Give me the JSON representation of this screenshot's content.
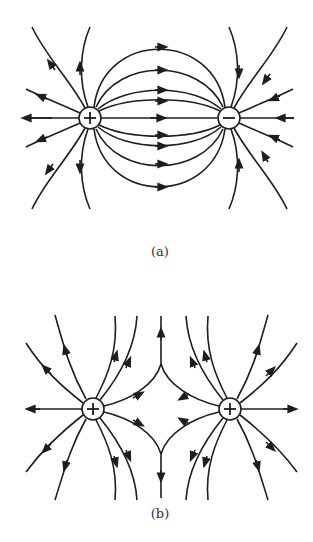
{
  "figure": {
    "panels": [
      {
        "id": "a",
        "caption": "(a)",
        "description": "Electric field lines between a positive and a negative charge (dipole)",
        "charges": [
          {
            "sign": "+",
            "label": "+",
            "x": 90,
            "y": 118
          },
          {
            "sign": "-",
            "label": "−",
            "x": 229,
            "y": 118
          }
        ],
        "field_direction": "from + to −"
      },
      {
        "id": "b",
        "caption": "(b)",
        "description": "Electric field lines between two positive charges",
        "charges": [
          {
            "sign": "+",
            "label": "+",
            "x": 93,
            "y": 409
          },
          {
            "sign": "+",
            "label": "+",
            "x": 230,
            "y": 409
          }
        ],
        "field_direction": "outward from both charges"
      }
    ],
    "colors": {
      "line": "#1e1e1e",
      "background": "#ffffff",
      "caption": "#333333"
    }
  }
}
